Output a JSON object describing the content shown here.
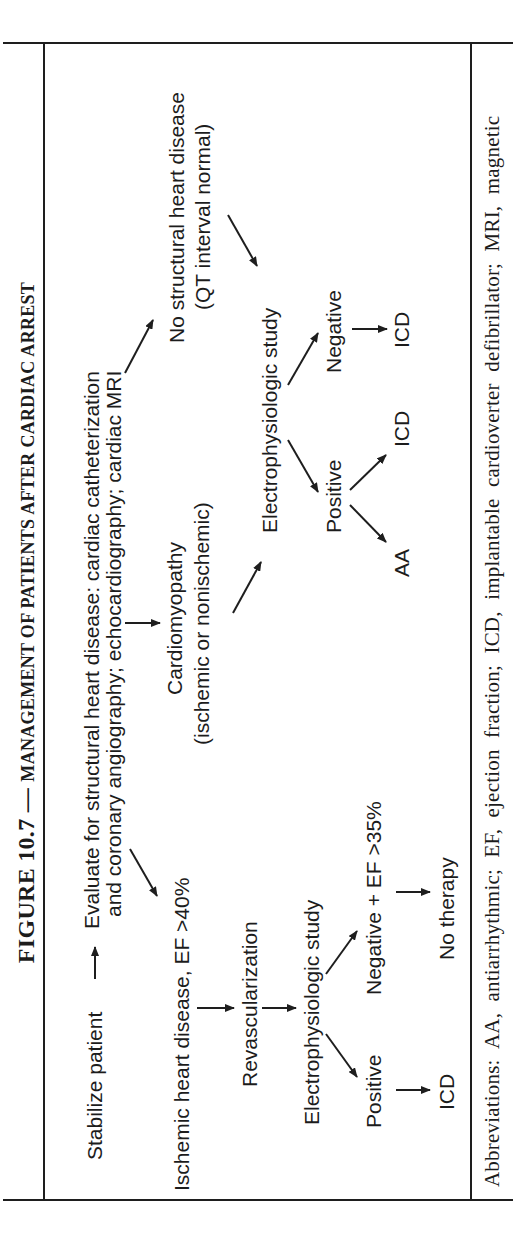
{
  "figure": {
    "title_prefix": "FIGURE 10.7 — ",
    "title_main": "Management of Patients After Cardiac Arrest",
    "title_display": "MANAGEMENT OF PATIENTS AFTER CARDIAC ARREST",
    "orientation": "rotated 90° counter-clockwise"
  },
  "flowchart": {
    "start": "Stabilize patient",
    "evaluate_line1": "Evaluate for structural heart disease: cardiac catheterization",
    "evaluate_line2": "and coronary angiography; echocardiography; cardiac MRI",
    "left_branch": {
      "condition": "Ischemic heart disease, EF >40%",
      "step1": "Revascularization",
      "step2": "Electrophysiologic study",
      "positive": "Positive",
      "positive_result": "ICD",
      "negative": "Negative + EF >35%",
      "negative_result": "No therapy"
    },
    "middle_branch": {
      "condition_line1": "Cardiomyopathy",
      "condition_line2": "(ischemic or nonischemic)",
      "step": "Electrophysiologic study",
      "positive": "Positive",
      "positive_result_a": "AA",
      "positive_result_b": "ICD",
      "negative": "Negative",
      "negative_result": "ICD"
    },
    "right_branch": {
      "condition_line1": "No structural heart disease",
      "condition_line2": "(QT interval normal)"
    }
  },
  "abbreviations": "Abbreviations: AA, antiarrhythmic; EF, ejection fraction; ICD, implantable cardioverter defibrillator; MRI, magnetic",
  "colors": {
    "background": "#ffffff",
    "ink": "#1c1c1c",
    "rules": "#1e1e1e"
  }
}
